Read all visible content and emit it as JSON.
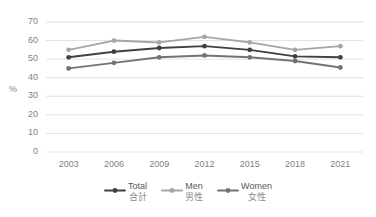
{
  "chart_data": {
    "type": "line",
    "title": "",
    "xlabel": "",
    "ylabel": "%",
    "categories": [
      "2003",
      "2006",
      "2009",
      "2012",
      "2015",
      "2018",
      "2021"
    ],
    "ylim": [
      0,
      70
    ],
    "y_ticks": [
      "0",
      "10",
      "20",
      "30",
      "40",
      "50",
      "60",
      "70"
    ],
    "grid": true,
    "legend_position": "bottom",
    "series": [
      {
        "name": "Total",
        "name_jp": "合計",
        "color": "#404040",
        "values": [
          51,
          54,
          56,
          57,
          55,
          51.5,
          51
        ]
      },
      {
        "name": "Men",
        "name_jp": "男性",
        "color": "#a6a6a6",
        "values": [
          55,
          60,
          59,
          62,
          59,
          55,
          57
        ]
      },
      {
        "name": "Women",
        "name_jp": "女性",
        "color": "#737373",
        "values": [
          45,
          48,
          51,
          52,
          51,
          49,
          45.5
        ]
      }
    ]
  },
  "axis": {
    "y_label": "%"
  },
  "legend": {
    "items": [
      {
        "label_en": "Total",
        "label_jp": "合計",
        "color": "#404040"
      },
      {
        "label_en": "Men",
        "label_jp": "男性",
        "color": "#a6a6a6"
      },
      {
        "label_en": "Women",
        "label_jp": "女性",
        "color": "#737373"
      }
    ]
  },
  "style": {
    "gridline_color": "#d9d9d9",
    "axis_text_color": "#7f7f7f",
    "background": "#ffffff"
  }
}
